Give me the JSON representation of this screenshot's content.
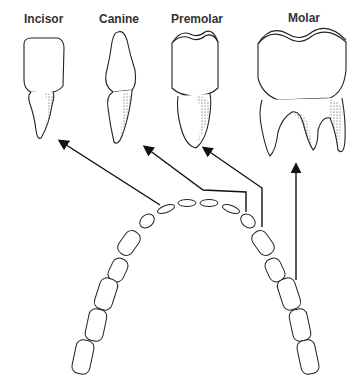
{
  "labels": {
    "incisor": "Incisor",
    "canine": "Canine",
    "premolar": "Premolar",
    "molar": "Molar"
  },
  "colors": {
    "ink": "#222222",
    "background": "#ffffff"
  }
}
